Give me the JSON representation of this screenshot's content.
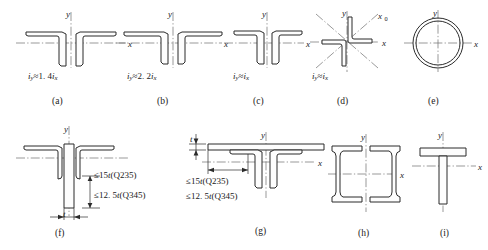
{
  "figure": {
    "panel_count": 9
  },
  "axes": {
    "x": "x",
    "y": "y",
    "x0": "x",
    "x0_sub": "0"
  },
  "panels": [
    {
      "id": "a",
      "caption": "(a)",
      "shape": "double-angle-back-to-back-long-legs",
      "ratio": "iᵧ≈ 1. 4iₓ",
      "ratio_lhs": "i",
      "ratio_lhs_sub": "y",
      "ratio_rel": "≈",
      "ratio_coef": "1. 4",
      "ratio_rhs": "i",
      "ratio_rhs_sub": "x"
    },
    {
      "id": "b",
      "caption": "(b)",
      "shape": "double-angle-short-legs-back-to-back",
      "ratio": "iᵧ≈2. 2iₓ",
      "ratio_lhs": "i",
      "ratio_lhs_sub": "y",
      "ratio_rel": "≈",
      "ratio_coef": "2. 2",
      "ratio_rhs": "i",
      "ratio_rhs_sub": "x"
    },
    {
      "id": "c",
      "caption": "(c)",
      "shape": "double-angle-equal-legs",
      "ratio": "iᵧ≈iₓ",
      "ratio_lhs": "i",
      "ratio_lhs_sub": "y",
      "ratio_rel": "≈",
      "ratio_coef": "",
      "ratio_rhs": "i",
      "ratio_rhs_sub": "x"
    },
    {
      "id": "d",
      "caption": "(d)",
      "shape": "cruciform-two-angles-rotated",
      "ratio": "iᵧ≈iₓ",
      "ratio_lhs": "i",
      "ratio_lhs_sub": "y",
      "ratio_rel": "≈",
      "ratio_coef": "",
      "ratio_rhs": "i",
      "ratio_rhs_sub": "x"
    },
    {
      "id": "e",
      "caption": "(e)",
      "shape": "circular-hollow-tube",
      "ratio": ""
    },
    {
      "id": "f",
      "caption": "(f)",
      "shape": "double-angle-with-web-plate",
      "limits": [
        {
          "rel": "≤",
          "value": "15",
          "var": "t",
          "grade": "(Q235)"
        },
        {
          "rel": "≤",
          "value": "12. 5",
          "var": "t",
          "grade": "(Q345)"
        }
      ],
      "thickness_label": "t"
    },
    {
      "id": "g",
      "caption": "(g)",
      "shape": "double-angle-with-cover-plate",
      "limits": [
        {
          "rel": "≤",
          "value": "15",
          "var": "t",
          "grade": "(Q235)"
        },
        {
          "rel": "≤",
          "value": "12. 5",
          "var": "t",
          "grade": "(Q345)"
        }
      ],
      "thickness_label": "t"
    },
    {
      "id": "h",
      "caption": "(h)",
      "shape": "double-channel-back-to-back",
      "ratio": ""
    },
    {
      "id": "i",
      "caption": "(i)",
      "shape": "welded-tee-section",
      "ratio": ""
    }
  ],
  "colors": {
    "outline": "#2b2b2b",
    "axis": "#6f6f6f",
    "background": "#ffffff",
    "text": "#1a1a1a"
  }
}
